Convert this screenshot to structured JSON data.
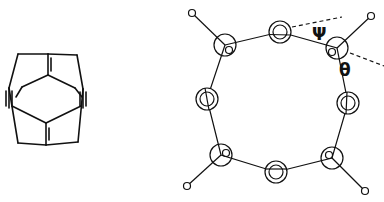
{
  "figure": {
    "left_panel": {
      "description": "cage molecule line drawing with two triple bonds and two double bonds"
    },
    "right_panel": {
      "description": "octagonal ring of eight atoms with four substituents",
      "angle_labels": {
        "psi": "Ψ",
        "theta": "θ"
      }
    },
    "colors": {
      "stroke": "#111111",
      "background": "#ffffff"
    }
  }
}
